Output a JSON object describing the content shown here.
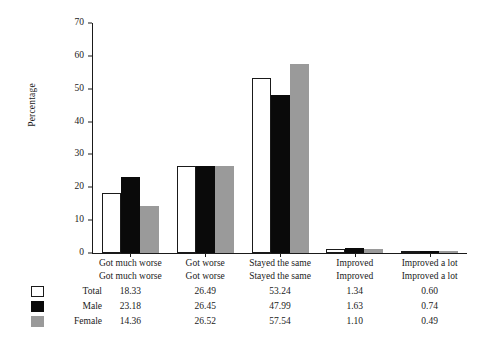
{
  "chart_data": {
    "type": "bar",
    "title": "",
    "xlabel": "",
    "ylabel": "Percentage",
    "ylim": [
      0,
      70
    ],
    "yticks": [
      0,
      10,
      20,
      30,
      40,
      50,
      60,
      70
    ],
    "grid": false,
    "legend_position": "bottom-table",
    "categories": [
      "Got much worse",
      "Got worse",
      "Stayed the same",
      "Improved",
      "Improved a lot"
    ],
    "series": [
      {
        "name": "Total",
        "color": "#ffffff",
        "values": [
          18.33,
          26.49,
          53.24,
          1.34,
          0.6
        ]
      },
      {
        "name": "Male",
        "color": "#0a0a0a",
        "values": [
          23.18,
          26.45,
          47.99,
          1.63,
          0.74
        ]
      },
      {
        "name": "Female",
        "color": "#9a9a9a",
        "values": [
          14.36,
          26.52,
          57.54,
          1.1,
          0.49
        ]
      }
    ],
    "value_labels": {
      "Total": [
        "18.33",
        "26.49",
        "53.24",
        "1.34",
        "0.60"
      ],
      "Male": [
        "23.18",
        "26.45",
        "47.99",
        "1.63",
        "0.74"
      ],
      "Female": [
        "14.36",
        "26.52",
        "57.54",
        "1.10",
        "0.49"
      ]
    },
    "ytick_labels": [
      "0",
      "10",
      "20",
      "30",
      "40",
      "50",
      "60",
      "70"
    ]
  }
}
